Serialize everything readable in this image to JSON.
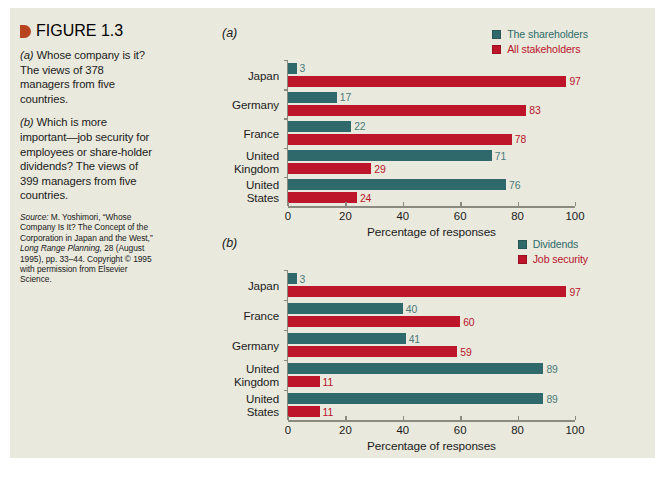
{
  "figure": {
    "marker_color": "#b8431f",
    "label": "FIGURE 1.3",
    "caption_a_prefix": "(a)",
    "caption_a": " Whose company is it? The views of 378 managers from five countries.",
    "caption_b_prefix": "(b)",
    "caption_b": " Which is more important—job security for employees or share-holder dividends? The views of 399 managers from five countries.",
    "source_label": "Source:",
    "source_text_1": " M. Yoshimori, “Whose Company Is It? The Concept of the Corporation in Japan and the West,” ",
    "source_italic_1": "Long Range Planning,",
    "source_text_2": " 28 (August 1995), pp. 33–44. Copyright © 1995 with permission from Elsevier Science."
  },
  "colors": {
    "panel_background": "#e9e9dd",
    "teal": "#30696b",
    "red": "#bd1529",
    "teal_value_text": "#4b7a7a",
    "red_value_text": "#b8142a",
    "axis": "#8a8a80"
  },
  "chart_data": [
    {
      "id": "a",
      "panel_letter": "(a)",
      "type": "bar",
      "orientation": "horizontal",
      "title": "",
      "xlabel": "Percentage of responses",
      "ylabel": "",
      "xlim": [
        0,
        100
      ],
      "xticks": [
        0,
        20,
        40,
        60,
        80,
        100
      ],
      "xtick_labels": [
        "0",
        "20",
        "40",
        "60",
        "80",
        "100"
      ],
      "grid": false,
      "legend_position": "top-right",
      "categories": [
        "Japan",
        "Germany",
        "France",
        "United\nKingdom",
        "United\nStates"
      ],
      "series": [
        {
          "name": "The shareholders",
          "color": "#30696b",
          "values": [
            3,
            17,
            22,
            71,
            76
          ]
        },
        {
          "name": "All stakeholders",
          "color": "#bd1529",
          "values": [
            97,
            83,
            78,
            29,
            24
          ]
        }
      ]
    },
    {
      "id": "b",
      "panel_letter": "(b)",
      "type": "bar",
      "orientation": "horizontal",
      "title": "",
      "xlabel": "Percentage of responses",
      "ylabel": "",
      "xlim": [
        0,
        100
      ],
      "xticks": [
        0,
        20,
        40,
        60,
        80,
        100
      ],
      "xtick_labels": [
        "0",
        "20",
        "40",
        "60",
        "80",
        "100"
      ],
      "grid": false,
      "legend_position": "top-right",
      "categories": [
        "Japan",
        "France",
        "Germany",
        "United\nKingdom",
        "United\nStates"
      ],
      "series": [
        {
          "name": "Dividends",
          "color": "#30696b",
          "values": [
            3,
            40,
            41,
            89,
            89
          ]
        },
        {
          "name": "Job security",
          "color": "#bd1529",
          "values": [
            97,
            60,
            59,
            11,
            11
          ]
        }
      ]
    }
  ]
}
